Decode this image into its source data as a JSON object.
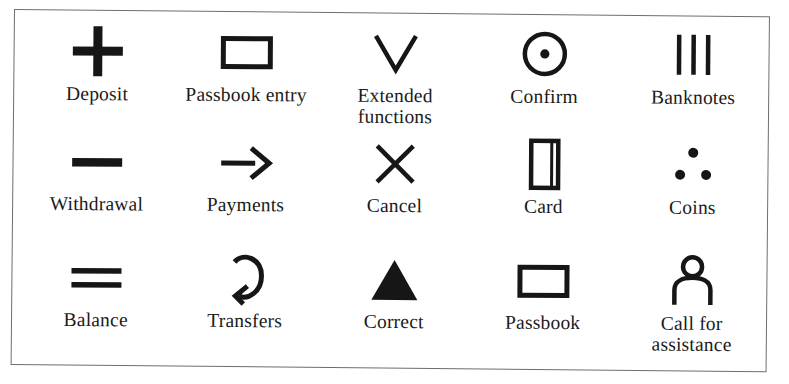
{
  "figure": {
    "kind": "icon-legend-table",
    "columns": 5,
    "rows": 3,
    "border_color": "#6e6e6e",
    "ink_color": "#161616",
    "background_color": "#ffffff"
  },
  "items": [
    {
      "icon": "plus-icon",
      "label": "Deposit"
    },
    {
      "icon": "rectangle-icon",
      "label": "Passbook entry"
    },
    {
      "icon": "chevron-down-icon",
      "label": "Extended functions"
    },
    {
      "icon": "circle-dot-icon",
      "label": "Confirm"
    },
    {
      "icon": "three-bars-icon",
      "label": "Banknotes"
    },
    {
      "icon": "minus-icon",
      "label": "Withdrawal"
    },
    {
      "icon": "arrow-right-icon",
      "label": "Payments"
    },
    {
      "icon": "cross-x-icon",
      "label": "Cancel"
    },
    {
      "icon": "card-icon",
      "label": "Card"
    },
    {
      "icon": "three-dots-icon",
      "label": "Coins"
    },
    {
      "icon": "equals-icon",
      "label": "Balance"
    },
    {
      "icon": "curved-arrow-icon",
      "label": "Transfers"
    },
    {
      "icon": "filled-triangle-icon",
      "label": "Correct"
    },
    {
      "icon": "rectangle-icon",
      "label": "Passbook"
    },
    {
      "icon": "person-icon",
      "label": "Call for assistance"
    }
  ]
}
